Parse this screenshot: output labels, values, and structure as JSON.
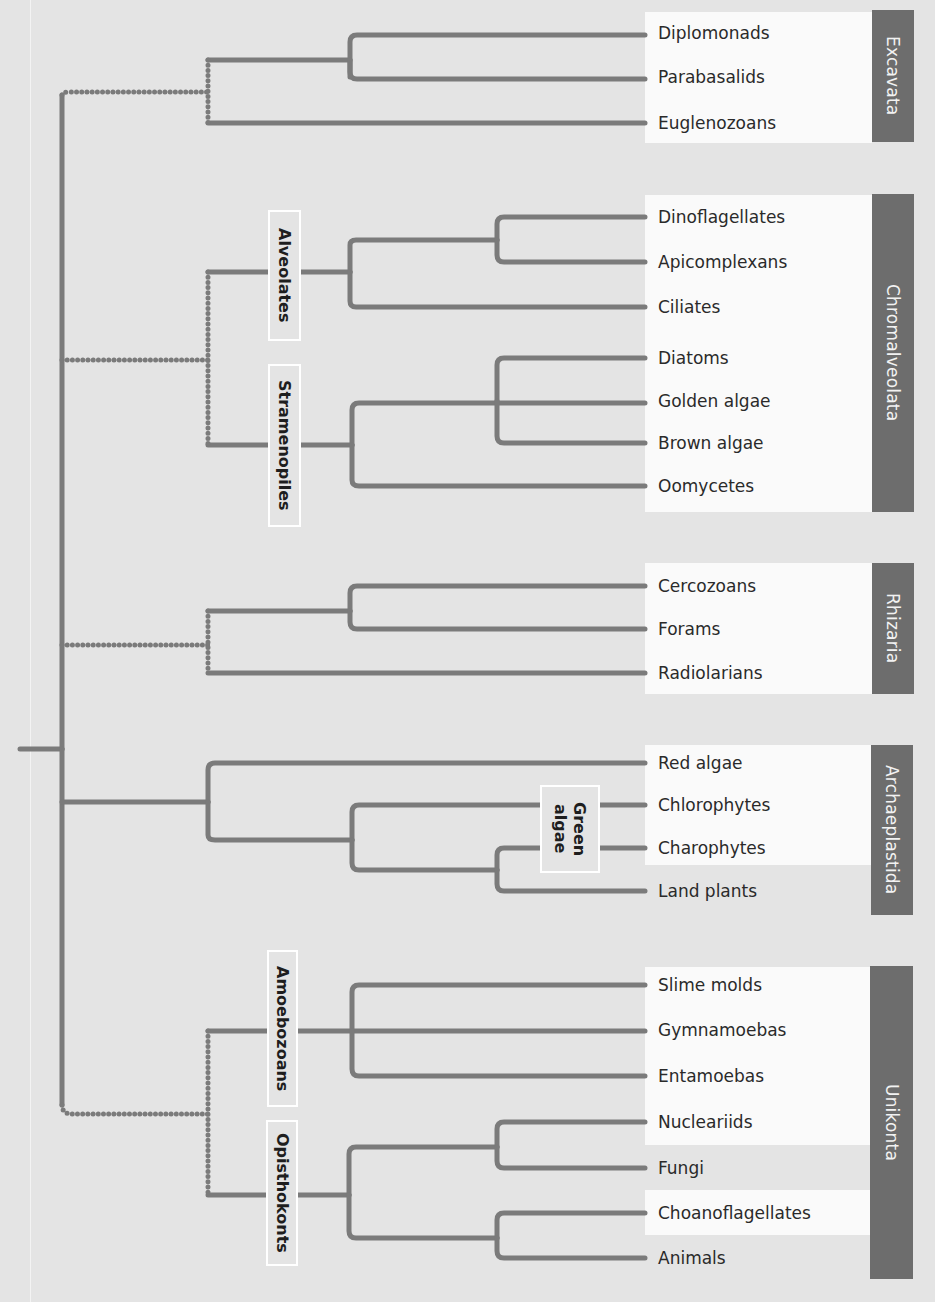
{
  "colors": {
    "background": "#e4e4e4",
    "branch": "#7b7b7b",
    "supergroup_bar": "#6d6d6d",
    "panel": "#fafafa"
  },
  "supergroups": [
    {
      "name": "Excavata",
      "bar": {
        "x": 872,
        "y": 10,
        "w": 42,
        "h": 132
      },
      "panels": [
        {
          "x": 645,
          "y": 12,
          "w": 227,
          "h": 131
        }
      ]
    },
    {
      "name": "Chromalveolata",
      "bar": {
        "x": 872,
        "y": 194,
        "w": 42,
        "h": 318
      },
      "panels": [
        {
          "x": 645,
          "y": 195,
          "w": 227,
          "h": 317
        }
      ]
    },
    {
      "name": "Rhizaria",
      "bar": {
        "x": 872,
        "y": 563,
        "w": 42,
        "h": 131
      },
      "panels": [
        {
          "x": 645,
          "y": 563,
          "w": 227,
          "h": 131
        }
      ]
    },
    {
      "name": "Archaeplastida",
      "bar": {
        "x": 871,
        "y": 745,
        "w": 42,
        "h": 170
      },
      "panels": [
        {
          "x": 645,
          "y": 745,
          "w": 226,
          "h": 120
        }
      ]
    },
    {
      "name": "Unikonta",
      "bar": {
        "x": 870,
        "y": 966,
        "w": 43,
        "h": 313
      },
      "panels": [
        {
          "x": 645,
          "y": 967,
          "w": 225,
          "h": 178
        },
        {
          "x": 645,
          "y": 1190,
          "w": 225,
          "h": 45
        }
      ]
    }
  ],
  "leaves": [
    {
      "name": "Diplomonads",
      "y": 33
    },
    {
      "name": "Parabasalids",
      "y": 77
    },
    {
      "name": "Euglenozoans",
      "y": 123
    },
    {
      "name": "Dinoflagellates",
      "y": 217
    },
    {
      "name": "Apicomplexans",
      "y": 262
    },
    {
      "name": "Ciliates",
      "y": 307
    },
    {
      "name": "Diatoms",
      "y": 358
    },
    {
      "name": "Golden algae",
      "y": 401
    },
    {
      "name": "Brown algae",
      "y": 443
    },
    {
      "name": "Oomycetes",
      "y": 486
    },
    {
      "name": "Cercozoans",
      "y": 586
    },
    {
      "name": "Forams",
      "y": 629
    },
    {
      "name": "Radiolarians",
      "y": 673
    },
    {
      "name": "Red algae",
      "y": 763
    },
    {
      "name": "Chlorophytes",
      "y": 805
    },
    {
      "name": "Charophytes",
      "y": 848
    },
    {
      "name": "Land plants",
      "y": 891
    },
    {
      "name": "Slime molds",
      "y": 985
    },
    {
      "name": "Gymnamoebas",
      "y": 1030
    },
    {
      "name": "Entamoebas",
      "y": 1076
    },
    {
      "name": "Nucleariids",
      "y": 1122
    },
    {
      "name": "Fungi",
      "y": 1168
    },
    {
      "name": "Choanoflagellates",
      "y": 1213
    },
    {
      "name": "Animals",
      "y": 1258
    }
  ],
  "clade_labels": [
    {
      "name": "Alveolates",
      "x": 268,
      "y": 210,
      "w": 33,
      "h": 131
    },
    {
      "name": "Stramenopiles",
      "x": 268,
      "y": 364,
      "w": 33,
      "h": 163
    },
    {
      "name": "Green\nalgae",
      "x": 540,
      "y": 785,
      "w": 60,
      "h": 88
    },
    {
      "name": "Amoebozoans",
      "x": 267,
      "y": 950,
      "w": 31,
      "h": 157
    },
    {
      "name": "Opisthokonts",
      "x": 266,
      "y": 1120,
      "w": 32,
      "h": 146
    }
  ],
  "edges": {
    "solid": [
      "M20 749 H62",
      "M62 749 V95",
      "M62 749 V1105",
      "M208 60 H350",
      "M350 77 V42 Q350 35 357 35 H645",
      "M350 60 V72 Q350 79 357 79 H645",
      "M208 123 H645",
      "M208 272 H350",
      "M350 272 V245 Q350 240 356 240 H497",
      "M350 272 V301 Q350 307 356 307 H645",
      "M497 240 V224 Q497 217 504 217 H645",
      "M497 240 V255 Q497 262 504 262 H645",
      "M208 445 H352",
      "M352 445 V410 Q352 403 359 403 H645",
      "M352 445 V480 Q352 486 359 486 H645",
      "M497 401 V365 Q497 358 504 358 H645",
      "M497 401 V436 Q497 443 504 443 H645",
      "M208 611 H350",
      "M350 611 V593 Q350 586 357 586 H645",
      "M350 611 V622 Q350 629 357 629 H645",
      "M208 673 H645",
      "M62 802 H208",
      "M208 802 V770 Q208 763 215 763 H645",
      "M208 802 V835 Q208 840 215 840 H352",
      "M352 840 V812 Q352 805 359 805 H645",
      "M352 840 V863 Q352 870 359 870 H497",
      "M497 870 V855 Q497 848 504 848 H645",
      "M497 870 V884 Q497 891 504 891 H645",
      "M208 1031 H645",
      "M352 1031 V992 Q352 985 359 985 H645",
      "M352 1031 V1069 Q352 1076 359 1076 H645",
      "M208 1195 H349",
      "M349 1195 V1154 Q349 1147 356 1147 H497",
      "M349 1195 V1231 Q349 1238 356 1238 H497",
      "M497 1147 V1129 Q497 1122 504 1122 H645",
      "M497 1147 V1161 Q497 1168 504 1168 H645",
      "M497 1238 V1220 Q497 1213 504 1213 H645",
      "M497 1238 V1251 Q497 1258 504 1258 H645"
    ],
    "dotted": [
      "M62 95 Q62 92 70 92 H208",
      "M208 60 V123",
      "M62 360 H208",
      "M208 272 V445",
      "M62 645 H208",
      "M208 611 V673",
      "M62 1105 Q62 1114 72 1114 H208",
      "M208 1031 V1195"
    ]
  }
}
